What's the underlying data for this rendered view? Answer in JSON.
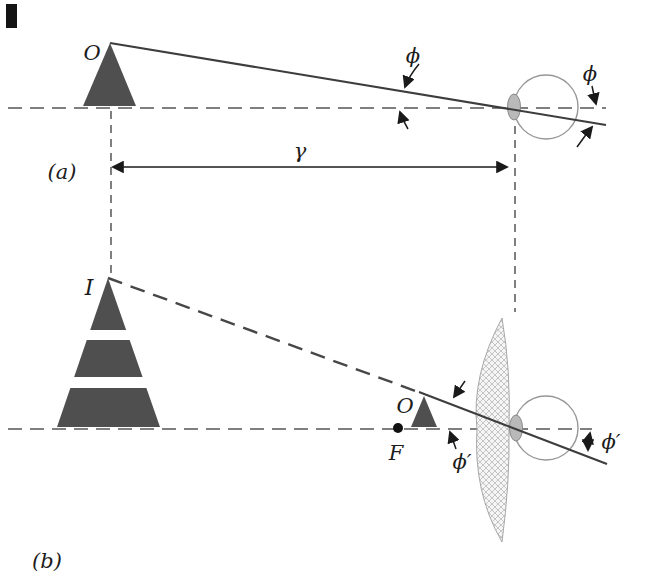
{
  "figure": {
    "labels": {
      "panel_a": "(a)",
      "panel_b": "(b)",
      "object_a": "O",
      "angle_a_left": "ϕ",
      "angle_a_right": "ϕ",
      "distance": "γ",
      "image_b": "I",
      "object_b": "O",
      "focal_point": "F",
      "angle_b_left": "ϕ′",
      "angle_b_right": "ϕ′"
    },
    "colors": {
      "triangle_fill": "#4f4f4f",
      "ray_line": "#3d3d3d",
      "dashed_line": "#555555",
      "eye_outline": "#979797",
      "cornea_fill": "#b9b9b9",
      "lens_fill": "#f5f5f5",
      "lens_hatch": "#bfbfbf",
      "focal_dot": "#111111",
      "background": "#ffffff"
    }
  }
}
